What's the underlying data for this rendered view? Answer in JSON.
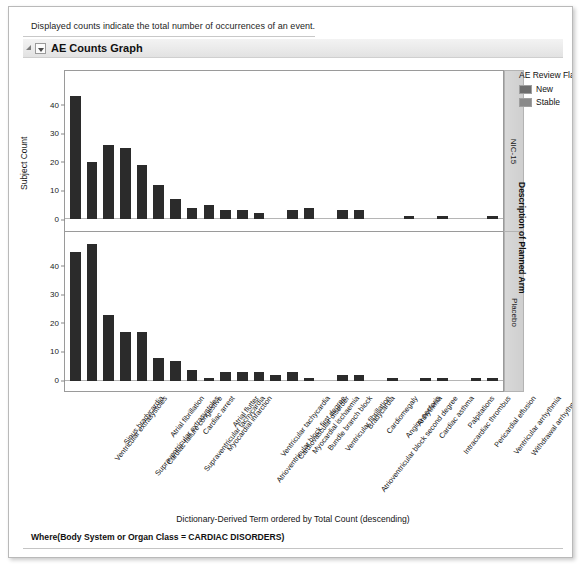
{
  "note": {
    "text": "Displayed counts indicate the total number of occurrences of an event."
  },
  "section": {
    "title": "AE Counts Graph",
    "expand_icon": "triangle-expand-icon",
    "collapse_icon": "chevron-down-icon"
  },
  "legend": {
    "title": "AE Review Flag",
    "items": [
      {
        "label": "New",
        "color": "#6e6e6e"
      },
      {
        "label": "Stable",
        "color": "#8a8a8a"
      }
    ]
  },
  "right_axis": {
    "title": "Description of Planned Arm",
    "panels": [
      {
        "label": "NIC-15"
      },
      {
        "label": "Placebo"
      }
    ]
  },
  "footer": {
    "x_axis_title": "Dictionary-Derived Term ordered by Total Count (descending)",
    "where_clause": "Where(Body System or Organ Class = CARDIAC DISORDERS)"
  },
  "chart_data": {
    "type": "bar",
    "title": "AE Counts Graph",
    "xlabel": "Dictionary-Derived Term ordered by Total Count (descending)",
    "ylabel": "Subject Count",
    "ylim": [
      0,
      48
    ],
    "grid": false,
    "legend_position": "right",
    "panel_variable": "Description of Planned Arm",
    "categories": [
      "Ventricular extrasystoles",
      "Sinus bradycardia",
      "Supraventricular extrasystoles",
      "Cardiac failure congestive",
      "Atrial fibrillation",
      "Supraventricular tachycardia",
      "Cardiac arrest",
      "Myocardial infarction",
      "Atrial flutter",
      "Atrioventricular block first degree",
      "Ventricular tachycardia",
      "Cardiovascular disorder",
      "Myocardial ischaemia",
      "Bundle branch block",
      "Ventricular fibrillation",
      "Atrioventricular block second degree",
      "Bradycardia",
      "Cardiomegaly",
      "Angina pectoris",
      "Arrhythmia",
      "Cardiac asthma",
      "Intracardiac thrombus",
      "Palpitations",
      "Pericardial effusion",
      "Ventricular arrhythmia",
      "Withdrawal arrhythmia"
    ],
    "panels": [
      {
        "name": "NIC-15",
        "yticks": [
          0,
          10,
          20,
          30,
          40
        ],
        "values": [
          43,
          20,
          26,
          25,
          19,
          12,
          7,
          4,
          5,
          3,
          3,
          2,
          0,
          3,
          4,
          0,
          3,
          3,
          0,
          0,
          1,
          0,
          1,
          0,
          0,
          1
        ]
      },
      {
        "name": "Placebo",
        "yticks": [
          0,
          10,
          20,
          30,
          40
        ],
        "values": [
          45,
          48,
          23,
          17,
          17,
          8,
          7,
          4,
          1,
          3,
          3,
          3,
          2,
          3,
          1,
          0,
          2,
          2,
          0,
          1,
          0,
          1,
          1,
          0,
          1,
          1
        ]
      }
    ]
  }
}
